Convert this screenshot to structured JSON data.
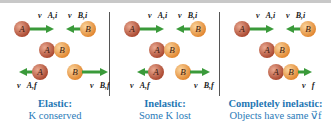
{
  "figure": {
    "panels": [
      {
        "id": "elastic",
        "title": "Elastic:",
        "subtitle": "K conserved",
        "labels": {
          "va_i": "v⃗A,i",
          "vb_i": "v⃗B,i",
          "va_f": "v⃗A,f",
          "vb_f": "v⃗B,f"
        }
      },
      {
        "id": "inelastic",
        "title": "Inelastic:",
        "subtitle": "Some K lost",
        "labels": {
          "va_i": "v⃗A,i",
          "vb_i": "v⃗B,i",
          "va_f": "v⃗A,f",
          "vb_f": "v⃗B,f"
        }
      },
      {
        "id": "completely-inelastic",
        "title": "Completely inelastic:",
        "subtitle": "Objects have same v⃗f",
        "labels": {
          "va_i": "v⃗A,i",
          "vb_i": "v⃗B,i",
          "v_f": "v⃗f"
        }
      }
    ],
    "ball_labels": {
      "a": "A",
      "b": "B"
    },
    "colors": {
      "ball_a": "#b5523a",
      "ball_b": "#e8943a",
      "arrow": "#3a9a3a",
      "caption": "#1f77b4"
    }
  }
}
